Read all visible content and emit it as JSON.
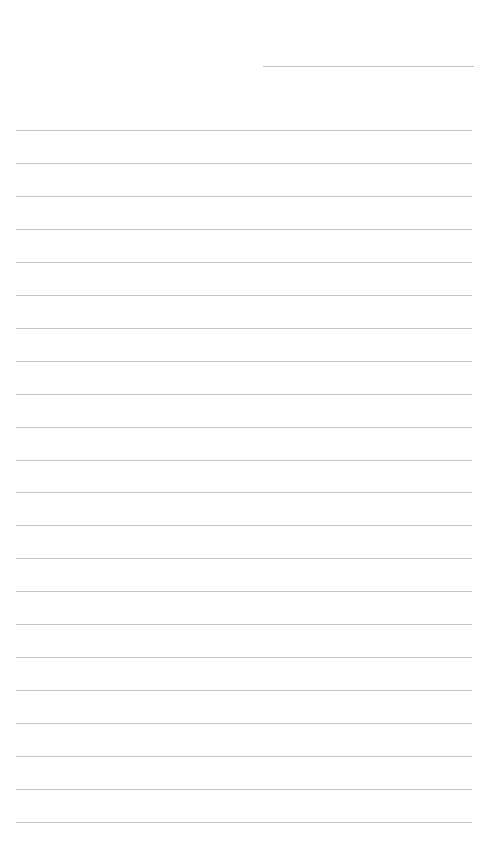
{
  "page": {
    "type": "lined-paper",
    "background": "#ffffff",
    "line_color": "#c4c4c4",
    "header_line": {
      "x1": 263,
      "x2": 474,
      "y": 66
    },
    "ruled_lines": {
      "x1": 16,
      "x2": 472,
      "count": 22,
      "first_y": 130,
      "spacing": 32.95
    }
  }
}
